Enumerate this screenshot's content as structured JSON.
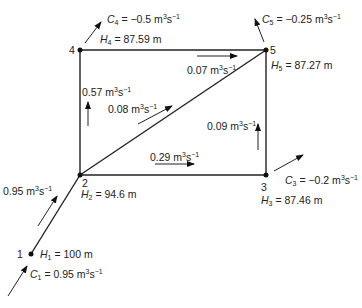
{
  "diagram": {
    "type": "pipe network",
    "nodes": [
      {
        "id": "1",
        "label": "1",
        "head_label": "H",
        "head_sub": "1",
        "head_value": "= 100 m",
        "demand_label": "C",
        "demand_sub": "1",
        "demand_value": "= 0.95 m",
        "demand_unit_tail": "s",
        "demand_exp1": "3",
        "demand_exp2": "−1"
      },
      {
        "id": "2",
        "label": "2",
        "head_label": "H",
        "head_sub": "2",
        "head_value": "= 94.6 m"
      },
      {
        "id": "3",
        "label": "3",
        "head_label": "H",
        "head_sub": "3",
        "head_value": "= 87.46 m",
        "demand_label": "C",
        "demand_sub": "3",
        "demand_value": "= −0.2 m",
        "demand_unit_tail": "s",
        "demand_exp1": "3",
        "demand_exp2": "−1"
      },
      {
        "id": "4",
        "label": "4",
        "head_label": "H",
        "head_sub": "4",
        "head_value": "= 87.59 m",
        "demand_label": "C",
        "demand_sub": "4",
        "demand_value": "= −0.5 m",
        "demand_unit_tail": "s",
        "demand_exp1": "3",
        "demand_exp2": "−1"
      },
      {
        "id": "5",
        "label": "5",
        "head_label": "H",
        "head_sub": "5",
        "head_value": "= 87.27 m",
        "demand_label": "C",
        "demand_sub": "5",
        "demand_value": "= −0.25 m",
        "demand_unit_tail": "s",
        "demand_exp1": "3",
        "demand_exp2": "−1"
      }
    ],
    "pipes": [
      {
        "from": "1",
        "to": "2",
        "flow_value": "0.95 m",
        "exp1": "3",
        "tail": "s",
        "exp2": "−1"
      },
      {
        "from": "2",
        "to": "4",
        "flow_value": "0.57 m",
        "exp1": "3",
        "tail": "s",
        "exp2": "−1"
      },
      {
        "from": "2",
        "to": "5",
        "flow_value": "0.08 m",
        "exp1": "3",
        "tail": "s",
        "exp2": "−1"
      },
      {
        "from": "2",
        "to": "3",
        "flow_value": "0.29 m",
        "exp1": "3",
        "tail": "s",
        "exp2": "−1"
      },
      {
        "from": "3",
        "to": "5",
        "flow_value": "0.09 m",
        "exp1": "3",
        "tail": "s",
        "exp2": "−1"
      },
      {
        "from": "4",
        "to": "5",
        "flow_value": "0.07 m",
        "exp1": "3",
        "tail": "s",
        "exp2": "−1"
      }
    ]
  }
}
